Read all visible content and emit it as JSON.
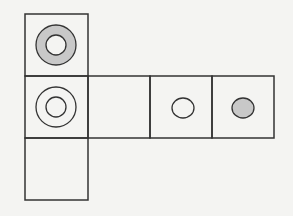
{
  "diagram": {
    "colors": {
      "background": "#f4f4f2",
      "line": "#333333",
      "fill_gray": "#c8c8c8",
      "cell_fill": "#f4f4f2"
    },
    "cells": [
      {
        "id": "top",
        "col": 0,
        "row": 0,
        "mark": "ring-gray-filled"
      },
      {
        "id": "middle-left",
        "col": 0,
        "row": 1,
        "mark": "double-circle"
      },
      {
        "id": "middle-2",
        "col": 1,
        "row": 1,
        "mark": "none"
      },
      {
        "id": "middle-3",
        "col": 2,
        "row": 1,
        "mark": "small-circle-open"
      },
      {
        "id": "middle-4",
        "col": 3,
        "row": 1,
        "mark": "small-circle-gray"
      },
      {
        "id": "bottom",
        "col": 0,
        "row": 2,
        "mark": "none"
      }
    ]
  }
}
